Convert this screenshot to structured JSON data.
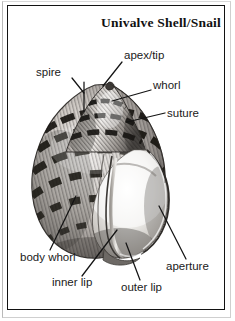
{
  "figure": {
    "title": "Univalve Shell/Snail",
    "style": "black-and-white engraving / halftone illustration",
    "frame_color": "#121212",
    "background_color": "#ffffff",
    "text_color": "#1a1a1a"
  },
  "labels": {
    "spire": "spire",
    "apex_tip": "apex/tip",
    "whorl": "whorl",
    "suture": "suture",
    "body_whorl": "body whorl",
    "inner_lip": "inner lip",
    "outer_lip": "outer lip",
    "aperture": "aperture"
  },
  "callouts": [
    {
      "id": "spire",
      "label": "spire",
      "side": "left",
      "text_x": 36,
      "text_y": 74
    },
    {
      "id": "apex-tip",
      "label": "apex/tip",
      "side": "right",
      "text_x": 124,
      "text_y": 58
    },
    {
      "id": "whorl",
      "label": "whorl",
      "side": "right",
      "text_x": 153,
      "text_y": 88
    },
    {
      "id": "suture",
      "label": "suture",
      "side": "right",
      "text_x": 167,
      "text_y": 116
    },
    {
      "id": "body-whorl",
      "label": "body whorl",
      "side": "left",
      "text_x": 20,
      "text_y": 260
    },
    {
      "id": "inner-lip",
      "label": "inner lip",
      "side": "left",
      "text_x": 52,
      "text_y": 285
    },
    {
      "id": "outer-lip",
      "label": "outer lip",
      "side": "right",
      "text_x": 121,
      "text_y": 290
    },
    {
      "id": "aperture",
      "label": "aperture",
      "side": "right",
      "text_x": 166,
      "text_y": 269
    }
  ]
}
